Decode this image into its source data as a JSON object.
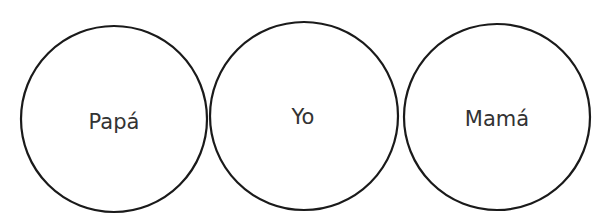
{
  "diagram": {
    "circles": [
      {
        "label": "Papá",
        "cx": 114,
        "cy": 119,
        "r": 93
      },
      {
        "label": "Yo",
        "cx": 304,
        "cy": 116,
        "r": 94
      },
      {
        "label": "Mamá",
        "cx": 497,
        "cy": 117,
        "r": 93
      }
    ],
    "stroke_color": "#1a1a1a",
    "text_color": "#333333"
  }
}
